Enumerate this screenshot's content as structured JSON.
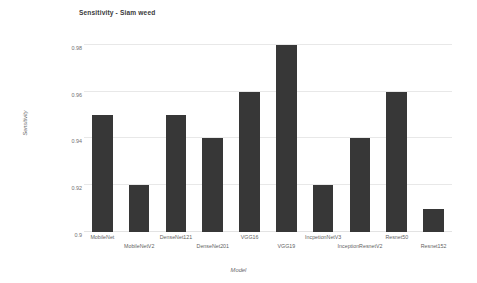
{
  "chart_data": {
    "type": "bar",
    "title": "Sensitivity - Siam weed",
    "xlabel": "Model",
    "ylabel": "Sensitivity",
    "categories": [
      "MobileNet",
      "MobileNetV2",
      "DenseNet121",
      "DenseNet201",
      "VGG16",
      "VGG19",
      "IncpetionNetV3",
      "InceptionResnetV2",
      "Resnet50",
      "Resnet152"
    ],
    "values": [
      0.95,
      0.92,
      0.95,
      0.94,
      0.96,
      0.98,
      0.92,
      0.94,
      0.96,
      0.91
    ],
    "ylim": [
      0.9,
      0.985
    ],
    "yticks": [
      0.98,
      0.96,
      0.94,
      0.92,
      0.9
    ],
    "ytick_labels": [
      "0.98",
      "0.96",
      "0.94",
      "0.92",
      "0.9"
    ],
    "grid": true,
    "legend": false,
    "bar_color": "#373737",
    "grid_color": "#e8e8e8",
    "background_color": "#ffffff"
  }
}
